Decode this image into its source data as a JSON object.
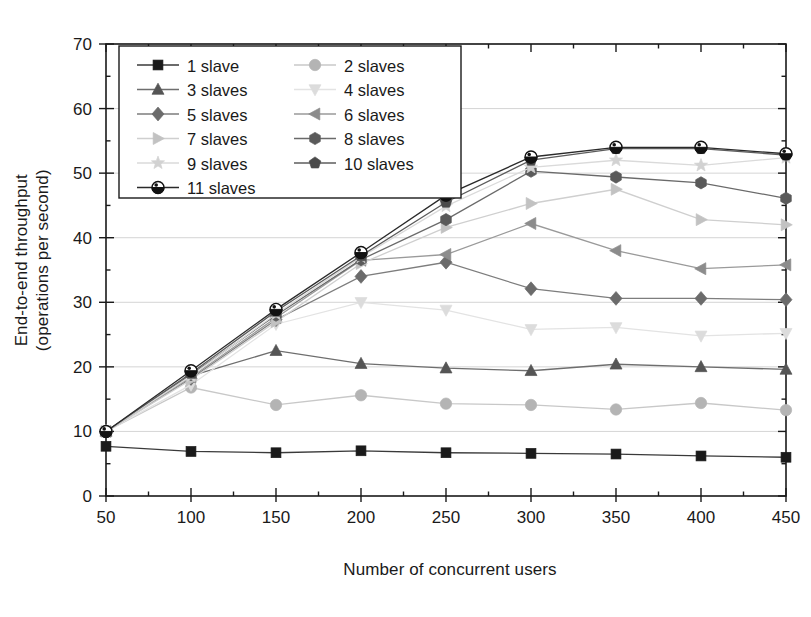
{
  "chart_data": {
    "type": "line",
    "title": "",
    "xlabel": "Number of concurrent users",
    "ylabel": "End-to-end throughput (operations per second)",
    "ylabel_line1": "End-to-end throughput",
    "ylabel_line2": "(operations per second)",
    "x": [
      50,
      100,
      150,
      200,
      250,
      300,
      350,
      400,
      450
    ],
    "xlim": [
      50,
      450
    ],
    "ylim": [
      0,
      70
    ],
    "xticks": [
      50,
      100,
      150,
      200,
      250,
      300,
      350,
      400,
      450
    ],
    "yticks": [
      0,
      10,
      20,
      30,
      40,
      50,
      60,
      70
    ],
    "y_minor_ticks": [
      5,
      15,
      25,
      35,
      45,
      55,
      65
    ],
    "grid": true,
    "grid_axis": "y",
    "legend_position": "upper-left-inside",
    "legend_columns": 2,
    "series": [
      {
        "name": "1 slave",
        "marker": "square",
        "color": "#1a1a1a",
        "line_color": "#3a3a3a",
        "values": [
          7.7,
          6.9,
          6.7,
          7.0,
          6.7,
          6.6,
          6.5,
          6.2,
          6.0
        ]
      },
      {
        "name": "2  slaves",
        "marker": "circle",
        "color": "#b4b4b4",
        "line_color": "#c8c8c8",
        "values": [
          10.0,
          16.8,
          14.1,
          15.6,
          14.3,
          14.1,
          13.4,
          14.4,
          13.3
        ]
      },
      {
        "name": "3 slaves",
        "marker": "triangle-up",
        "color": "#555555",
        "line_color": "#6e6e6e",
        "values": [
          10.0,
          18.6,
          22.5,
          20.5,
          19.8,
          19.4,
          20.4,
          20.0,
          19.6
        ]
      },
      {
        "name": "4 slaves",
        "marker": "triangle-down",
        "color": "#dcdcdc",
        "line_color": "#e3e3e3",
        "values": [
          10.0,
          17.2,
          26.6,
          30.0,
          28.8,
          25.8,
          26.1,
          24.8,
          25.2
        ]
      },
      {
        "name": "5 slaves",
        "marker": "diamond",
        "color": "#6b6b6b",
        "line_color": "#7d7d7d",
        "values": [
          10.0,
          18.2,
          27.3,
          34.0,
          36.2,
          32.1,
          30.6,
          30.6,
          30.4
        ]
      },
      {
        "name": "6 slaves",
        "marker": "triangle-left",
        "color": "#8c8c8c",
        "line_color": "#9a9a9a",
        "values": [
          10.0,
          18.4,
          27.6,
          36.5,
          37.4,
          42.2,
          38.0,
          35.2,
          35.8
        ]
      },
      {
        "name": "7 slaves",
        "marker": "triangle-right",
        "color": "#c2c2c2",
        "line_color": "#cfcfcf",
        "values": [
          10.0,
          18.0,
          27.0,
          36.0,
          41.6,
          45.3,
          47.5,
          42.8,
          42.0
        ]
      },
      {
        "name": "8 slaves",
        "marker": "hexagon",
        "color": "#5a5a5a",
        "line_color": "#6a6a6a",
        "values": [
          10.0,
          18.8,
          28.0,
          36.6,
          42.8,
          50.3,
          49.4,
          48.5,
          46.1
        ]
      },
      {
        "name": "9 slaves",
        "marker": "star",
        "color": "#d2d2d2",
        "line_color": "#dadada",
        "values": [
          10.0,
          18.6,
          28.2,
          37.0,
          44.9,
          50.9,
          52.0,
          51.2,
          52.4
        ]
      },
      {
        "name": "10 slaves",
        "marker": "pentagon",
        "color": "#4a4a4a",
        "line_color": "#5c5c5c",
        "values": [
          10.0,
          19.0,
          28.6,
          37.2,
          45.5,
          52.0,
          53.8,
          53.8,
          52.8
        ]
      },
      {
        "name": "11 slaves",
        "marker": "circle-half",
        "color": "#111111",
        "line_color": "#2a2a2a",
        "values": [
          10.0,
          19.4,
          28.9,
          37.7,
          46.6,
          52.5,
          54.0,
          54.0,
          53.0
        ]
      }
    ]
  },
  "axes": {
    "x_tick_labels": [
      "50",
      "100",
      "150",
      "200",
      "250",
      "300",
      "350",
      "400",
      "450"
    ],
    "y_tick_labels": [
      "0",
      "10",
      "20",
      "30",
      "40",
      "50",
      "60",
      "70"
    ]
  },
  "legend": {
    "entries": [
      "1 slave",
      "2  slaves",
      "3 slaves",
      "4 slaves",
      "5 slaves",
      "6 slaves",
      "7 slaves",
      "8 slaves",
      "9 slaves",
      "10 slaves",
      "11 slaves"
    ]
  }
}
